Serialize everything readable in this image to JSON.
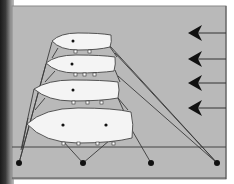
{
  "diagram": {
    "type": "mooring-raft-diagram",
    "colors": {
      "background": "#b9b9b9",
      "border": "#555555",
      "hull_fill": "#f4f4f4",
      "line": "#3a3a3a",
      "anchor": "#111111",
      "arrow": "#111111"
    },
    "boats": [
      {
        "id": "boat-1",
        "position": "top"
      },
      {
        "id": "boat-2",
        "position": "second"
      },
      {
        "id": "boat-3",
        "position": "third"
      },
      {
        "id": "boat-4",
        "position": "bottom"
      }
    ],
    "anchors": [
      {
        "id": "anchor-1",
        "x": 19
      },
      {
        "id": "anchor-2",
        "x": 83
      },
      {
        "id": "anchor-3",
        "x": 151
      },
      {
        "id": "anchor-4",
        "x": 217
      }
    ],
    "arrows": {
      "count": 4,
      "direction": "left",
      "meaning": "wind-or-current"
    }
  }
}
